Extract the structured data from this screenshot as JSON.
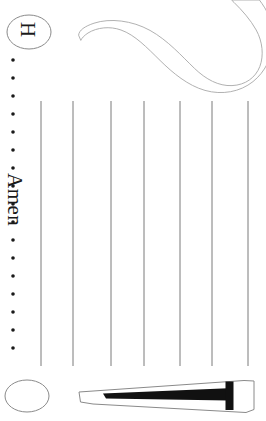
{
  "page": {
    "width": 266,
    "height": 421,
    "background_color": "#ffffff",
    "orientation_note": "rotated-90",
    "ink_color": "#1a1a1a",
    "rule_line_color": "#7a7a7a",
    "outline_color": "#a8a8a8"
  },
  "badge": {
    "name": "letter-badge",
    "letter": "H",
    "shape": "ellipse",
    "cx": 29,
    "cy": 32,
    "rx": 22,
    "ry": 17
  },
  "margin_note": {
    "text": "Amen",
    "rotation_deg": 90
  },
  "dotted_margin": {
    "dot_color": "#1a1a1a",
    "dot_x": 13,
    "dot_radius": 1.8,
    "dot_count": 17,
    "dot_spacing": 18,
    "dot_start_y": 60
  },
  "ruled_columns": {
    "count": 7,
    "x_positions": [
      41,
      73,
      111,
      144,
      180,
      212,
      248
    ],
    "y_top": 101,
    "y_bottom": 366,
    "stroke_width": 1
  },
  "glyph_hook": {
    "name": "hook-outline-glyph",
    "description": "large curved hook stroke outline",
    "fill": "#ffffff",
    "stroke": "#a8a8a8"
  },
  "bottom_ellipse": {
    "name": "empty-badge",
    "cx": 27,
    "cy": 396,
    "rx": 22,
    "ry": 16,
    "fill": "#ffffff",
    "stroke": "#8a8a8a"
  },
  "glyph_wedge": {
    "name": "wedge-outline-glyph",
    "description": "long tapered wedge with black T-shaped ink mark",
    "fill": "#ffffff",
    "stroke": "#8a8a8a",
    "ink_color": "#111111"
  }
}
